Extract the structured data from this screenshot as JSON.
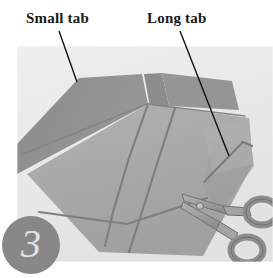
{
  "figure": {
    "step_number": "3",
    "alt_description": "Grayscale photo of folded fabric panel with seam lines, a small tab and a long tab, with scissors resting at lower right"
  },
  "annotations": [
    {
      "id": "small-tab",
      "label": "Small tab",
      "leader": {
        "x1": 59,
        "y1": 31,
        "x2": 77,
        "y2": 82
      }
    },
    {
      "id": "long-tab",
      "label": "Long tab",
      "leader": {
        "x1": 180,
        "y1": 31,
        "x2": 229,
        "y2": 156
      }
    }
  ],
  "colors": {
    "page_background": "#ffffff",
    "photo_background": "#e9e9e9",
    "fabric_main": "#a9a9a9",
    "fabric_flap": "#8f8f8f",
    "fabric_light": "#b6b6b6",
    "seam_line": "#7c7c7c",
    "scissors_body": "#9b9b9b",
    "scissors_edge": "#6f6f6f",
    "badge_fill": "#878787",
    "badge_text": "#e2e2e2",
    "label_text": "#1a1a1a",
    "leader_line": "#111111"
  },
  "photo": {
    "left": 17,
    "top": 46,
    "width": 256,
    "height": 216
  },
  "badge": {
    "left": 2,
    "top": 216,
    "diameter": 58
  },
  "scene_objects": [
    {
      "name": "fabric-panel",
      "description": "large folded gray fabric panel"
    },
    {
      "name": "small-tab",
      "description": "short flap at upper left of panel"
    },
    {
      "name": "long-tab",
      "description": "long flap along right edge of panel"
    },
    {
      "name": "seam-line-left",
      "description": "diagonal stitched seam"
    },
    {
      "name": "seam-line-right",
      "description": "second parallel diagonal stitched seam"
    },
    {
      "name": "seam-line-bottom",
      "description": "horizontal hem seam near bottom"
    },
    {
      "name": "scissors",
      "description": "pair of scissors lying on work surface"
    }
  ]
}
